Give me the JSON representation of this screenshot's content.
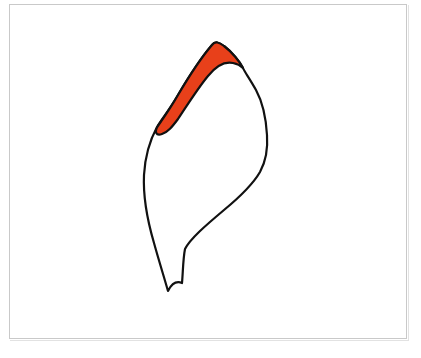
{
  "figure": {
    "title": "Outlined organic shape with highlighted marginal band",
    "background_color": "#ffffff",
    "panel": {
      "border_color": "#c9c9c9",
      "shadow_color": "#e2e2e2",
      "x": 9,
      "y": 4,
      "width": 398,
      "height": 335
    },
    "stroke": {
      "color": "#111111",
      "width": 2.2
    },
    "regions": [
      {
        "id": "highlight-band",
        "label": "highlighted-margin-band",
        "fill_color": "#E8401A",
        "outline_color": "#111111",
        "outline_width": 2.2,
        "path": "M 212 45 C 206 52 191 73 178 95 C 170 109 162 120 158 126 C 154 132 156 136 162 134 C 168 132 172 127 178 119 C 188 104 198 88 208 76 C 216 66 224 61 233 63 C 238 64 241 66 243 68 C 240 62 232 52 224 46 C 219 42 215 41 212 45 Z"
      },
      {
        "id": "body-outline",
        "label": "main-shape-outline",
        "fill_color": "none",
        "outline_color": "#111111",
        "outline_width": 2.2,
        "path": "M 212 45 C 206 52 191 73 178 95 C 170 109 161 120 157 127 C 150 140 145 157 144 175 C 143 196 147 219 154 243 C 159 261 164 277 168 291 C 172 283 177 281 182 283 C 183 272 183 259 185 249 C 190 239 205 226 224 210 C 241 196 253 184 260 172 C 266 161 268 149 267 135 C 266 118 262 101 256 90 C 250 79 244 71 243 68 C 240 62 232 52 224 46 C 219 42 215 41 212 45 Z"
      }
    ],
    "annotations": []
  },
  "chart_data": {
    "type": "scatter",
    "title": "Outlined organic shape with highlighted marginal band",
    "xlabel": "",
    "ylabel": "",
    "legend": [],
    "series": []
  }
}
